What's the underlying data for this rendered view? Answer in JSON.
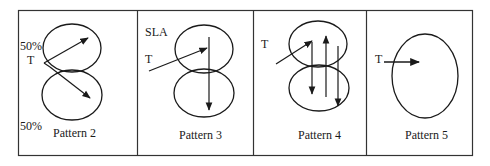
{
  "figure": {
    "panels": [
      {
        "id": "pattern-2",
        "caption": "Pattern 2",
        "labels": [
          {
            "text": "50%",
            "role": "upper-percentage"
          },
          {
            "text": "T",
            "role": "tracer-start"
          },
          {
            "text": "50%",
            "role": "lower-percentage"
          }
        ]
      },
      {
        "id": "pattern-3",
        "caption": "Pattern 3",
        "labels": [
          {
            "text": "SLA",
            "role": "structure-label"
          },
          {
            "text": "T",
            "role": "tracer-start"
          }
        ]
      },
      {
        "id": "pattern-4",
        "caption": "Pattern 4",
        "labels": [
          {
            "text": "T",
            "role": "tracer-start"
          }
        ]
      },
      {
        "id": "pattern-5",
        "caption": "Pattern 5",
        "labels": [
          {
            "text": "T",
            "role": "tracer-start"
          }
        ]
      }
    ],
    "colors": {
      "stroke": "#1a1a1a",
      "border": "#333333",
      "background": "#ffffff"
    }
  }
}
